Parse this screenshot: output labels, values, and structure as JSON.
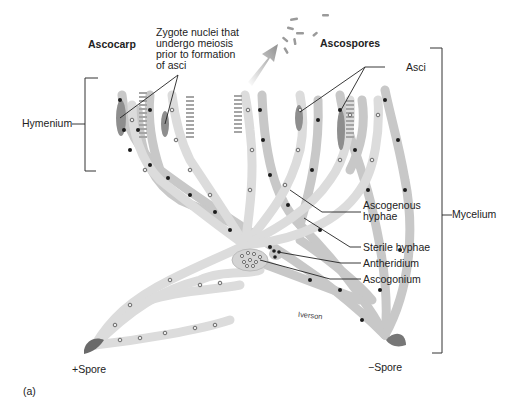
{
  "figure": {
    "panel_label": "(a)",
    "credit": "Iverson",
    "colors": {
      "hypha_fill": "#d6d6d6",
      "hypha_stroke": "#b9b9b9",
      "plus_nucleus": "#7a7a7a",
      "minus_nucleus": "#1a1a1a",
      "ascus_fill": "#8d8d8d",
      "spore_fill": "#6e6e6e",
      "arrow_color": "#9c9c9c",
      "leader_line": "#222222"
    }
  },
  "labels": {
    "ascocarp": "Ascocarp",
    "zygote_nuclei": [
      "Zygote nuclei that",
      "undergo meiosis",
      "prior to formation",
      "of asci"
    ],
    "ascospores": "Ascospores",
    "asci": "Asci",
    "hymenium": "Hymenium",
    "ascogenous_hyphae": [
      "Ascogenous",
      "hyphae"
    ],
    "mycelium": "Mycelium",
    "sterile_hyphae": "Sterile hyphae",
    "antheridium": "Antheridium",
    "ascogonium": "Ascogonium",
    "plus_spore": "+Spore",
    "minus_spore": "−Spore"
  }
}
